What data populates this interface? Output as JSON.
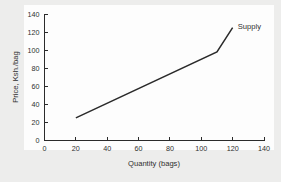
{
  "chart_data": {
    "type": "line",
    "title": "",
    "xlabel": "Quantity (bags)",
    "ylabel": "Price, Ksh./bag",
    "xlim": [
      0,
      140
    ],
    "ylim": [
      0,
      140
    ],
    "xticks": [
      0,
      20,
      40,
      60,
      80,
      100,
      120,
      140
    ],
    "yticks": [
      0,
      20,
      40,
      60,
      80,
      100,
      120,
      140
    ],
    "xtick_labels": [
      "0",
      "20",
      "40",
      "60",
      "80",
      "100",
      "120",
      "140"
    ],
    "ytick_labels": [
      "0",
      "20",
      "40",
      "60",
      "80",
      "100",
      "120",
      "140"
    ],
    "grid": false,
    "legend_position": "inline-annotation-right",
    "series": [
      {
        "name": "Supply",
        "color": "#2a2a2a",
        "x": [
          20,
          110,
          120
        ],
        "y": [
          25,
          98,
          125
        ],
        "points": [
          {
            "x": 20,
            "y": 25
          },
          {
            "x": 110,
            "y": 98
          },
          {
            "x": 120,
            "y": 125
          }
        ]
      }
    ],
    "annotations": [
      {
        "text": "Supply",
        "x": 122,
        "y": 126
      }
    ]
  },
  "figure": {
    "background_color": "#ededec",
    "plot_background_color": "#fdfdfd",
    "axis_color": "#2b2b2b"
  }
}
